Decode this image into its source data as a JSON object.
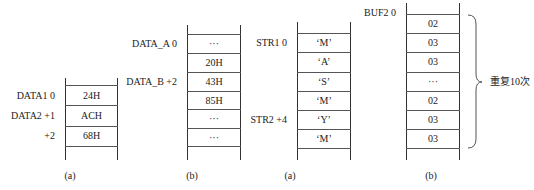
{
  "figures": [
    {
      "id": "fig1a",
      "caption": "(a)",
      "cells": [
        "24H",
        "ACH",
        "68H"
      ],
      "labels": [
        {
          "text": "DATA1  0",
          "row": 0
        },
        {
          "text": "DATA2  +1",
          "row": 1
        },
        {
          "text": "+2",
          "row": 2
        }
      ]
    },
    {
      "id": "fig1b",
      "caption": "(b)",
      "cells": [
        "···",
        "20H",
        "43H",
        "85H",
        "···",
        "···"
      ],
      "labels": [
        {
          "text": "DATA_A  0",
          "row": 0
        },
        {
          "text": "DATA_B  +2",
          "row": 2
        }
      ]
    },
    {
      "id": "fig2a",
      "caption": "(a)",
      "cells": [
        "‘M’",
        "‘A’",
        "‘S’",
        "‘M’",
        "‘Y’",
        "‘M’"
      ],
      "labels": [
        {
          "text": "STR1  0",
          "row": 0
        },
        {
          "text": "STR2  +4",
          "row": 4
        }
      ]
    },
    {
      "id": "fig2b",
      "caption": "(b)",
      "cells": [
        "02",
        "03",
        "03",
        "···",
        "02",
        "03",
        "03"
      ],
      "labels": [
        {
          "text": "BUF2  0",
          "row": 0
        }
      ],
      "brace_note": "重复10次"
    }
  ]
}
